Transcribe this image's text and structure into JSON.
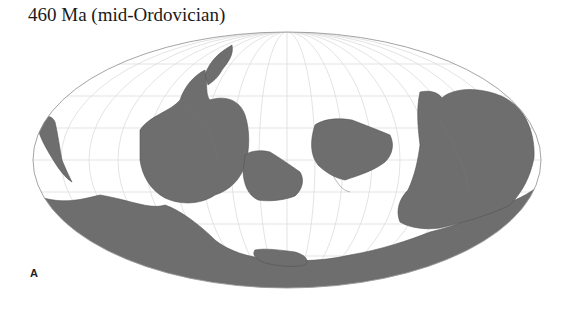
{
  "figure": {
    "title": "460 Ma (mid-Ordovician)",
    "panel_label": "A",
    "projection": "Mollweide",
    "colors": {
      "land": "#6e6e6e",
      "coastline": "#555555",
      "graticule": "#d6d6d6",
      "outline": "#9a9a9a",
      "background": "#ffffff"
    }
  }
}
